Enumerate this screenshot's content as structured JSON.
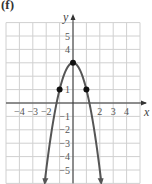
{
  "figure_label": "(f)",
  "chart_data": {
    "type": "line",
    "title": "",
    "xlabel": "x",
    "ylabel": "y",
    "xlim": [
      -5,
      5
    ],
    "ylim": [
      -6,
      6
    ],
    "grid": true,
    "x_tick_labels": [
      "-4",
      "-3",
      "-2",
      "2",
      "3",
      "4"
    ],
    "y_tick_labels": [
      "5",
      "4",
      "1",
      "-1",
      "-2",
      "-3",
      "-4",
      "-5"
    ],
    "series": [
      {
        "name": "parabola",
        "equation": "y = 3 - 2x^2",
        "x": [
          -2.1,
          -1.5,
          -1,
          -0.5,
          0,
          0.5,
          1,
          1.5,
          2.1
        ],
        "y": [
          -5.82,
          -1.5,
          1,
          2.5,
          3,
          2.5,
          1,
          -1.5,
          -5.82
        ],
        "arrows_at_ends": true
      }
    ],
    "marked_points": [
      {
        "x": -1,
        "y": 1
      },
      {
        "x": 0,
        "y": 3
      },
      {
        "x": 1,
        "y": 1
      }
    ]
  },
  "colors": {
    "grid": "#d0d0d0",
    "axis": "#333333",
    "curve": "#555555",
    "points": "#111111"
  }
}
